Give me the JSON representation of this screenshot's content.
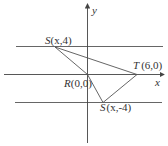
{
  "diagram": {
    "axes": {
      "x_label": "x",
      "y_label": "y"
    },
    "horizontal_lines": [
      {
        "name": "line-y-4",
        "y_value": 4
      },
      {
        "name": "line-y-0",
        "y_value": 0
      },
      {
        "name": "line-y-neg4",
        "y_value": -4
      }
    ],
    "points": {
      "S_top": {
        "letter": "S",
        "coords": "(x,4)"
      },
      "R": {
        "letter": "R",
        "coords": "(0,0)"
      },
      "T": {
        "letter": "T",
        "coords": "(6,0)"
      },
      "S_bottom": {
        "letter": "S",
        "coords": "(x,-4)"
      }
    },
    "colors": {
      "line": "#555555",
      "text": "#333333",
      "background": "#ffffff"
    }
  }
}
